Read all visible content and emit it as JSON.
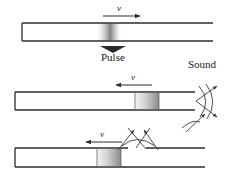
{
  "figure": {
    "background_color": "#ffffff",
    "line_color": "#2b2b2b",
    "pulse_dark": "#8f8f8f",
    "pulse_light": "#f2f2f2"
  },
  "labels": {
    "velocity_panel1": "v",
    "velocity_panel2": "v",
    "velocity_panel3": "v",
    "pulse": "Pulse",
    "sound": "Sound"
  },
  "panels": [
    {
      "index": 1,
      "description": "tube with diffuse compression pulse near middle-right, velocity arrow pointing right above tube, pulse brace label below",
      "tube_left_end": "closed",
      "tube_right_end": "open",
      "pulse_style": "diffuse-gradient",
      "arrow_direction": "right",
      "velocity_label": "v",
      "extra_label": "Pulse"
    },
    {
      "index": 2,
      "description": "tube with defined rectangular pulse at right, velocity arrow pointing left, sound radiating from open right end",
      "tube_left_end": "closed",
      "tube_right_end": "open",
      "pulse_style": "rectangle-gradient",
      "arrow_direction": "left",
      "velocity_label": "v",
      "extra_label": "Sound"
    },
    {
      "index": 3,
      "description": "tube with rectangular pulse mid-left and a gap in the upper wall, velocity arrow pointing left, sound radiating outward through the gap",
      "tube_left_end": "closed",
      "tube_right_end": "open",
      "pulse_style": "rectangle-gradient",
      "arrow_direction": "left",
      "velocity_label": "v",
      "has_wall_gap": "true"
    }
  ]
}
